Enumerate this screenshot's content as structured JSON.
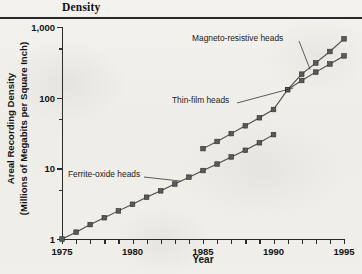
{
  "page": {
    "title": "Density",
    "xaxis_title": "Year",
    "yaxis_title_line1": "Areal Recording Density",
    "yaxis_title_line2": "(Millions of Megabits per Square Inch)"
  },
  "annotations": {
    "magneto": "Magneto-resistive heads",
    "thinfilm": "Thin-film heads",
    "ferrite": "Ferrite-oxide heads"
  },
  "chart_data": {
    "type": "line",
    "title": "Density",
    "xlabel": "Year",
    "ylabel": "Areal Recording Density (Millions of Megabits per Square Inch)",
    "xlim": [
      1975,
      1995
    ],
    "ylim": [
      1,
      1000
    ],
    "yscale": "log",
    "grid": false,
    "legend": "none (inline annotations)",
    "ytick_labels": [
      "1",
      "10",
      "100",
      "1,000"
    ],
    "ytick_values": [
      1,
      10,
      100,
      1000
    ],
    "xtick_labels": [
      "1975",
      "1980",
      "1985",
      "1990",
      "1995"
    ],
    "xtick_values": [
      1975,
      1980,
      1985,
      1990,
      1995
    ],
    "xtick_minor_step": 1,
    "marker": "filled square",
    "series": [
      {
        "name": "Ferrite-oxide heads",
        "annotation": "Ferrite-oxide heads",
        "x": [
          1975,
          1976,
          1977,
          1978,
          1979,
          1980,
          1981,
          1982,
          1983,
          1984,
          1985,
          1986,
          1987,
          1988,
          1989,
          1990
        ],
        "y": [
          1.0,
          1.25,
          1.6,
          2.0,
          2.5,
          3.1,
          3.9,
          4.8,
          6.0,
          7.5,
          9.3,
          11.5,
          14.5,
          18,
          23,
          30
        ]
      },
      {
        "name": "Thin-film heads",
        "annotation": "Thin-film heads",
        "x": [
          1985,
          1986,
          1987,
          1988,
          1989,
          1990,
          1991,
          1992,
          1993,
          1994,
          1995
        ],
        "y": [
          19,
          24,
          31,
          40,
          52,
          68,
          130,
          175,
          230,
          300,
          390
        ]
      },
      {
        "name": "Magneto-resistive heads",
        "annotation": "Magneto-resistive heads",
        "x": [
          1991,
          1992,
          1993,
          1994,
          1995
        ],
        "y": [
          130,
          215,
          310,
          450,
          680
        ]
      }
    ]
  }
}
